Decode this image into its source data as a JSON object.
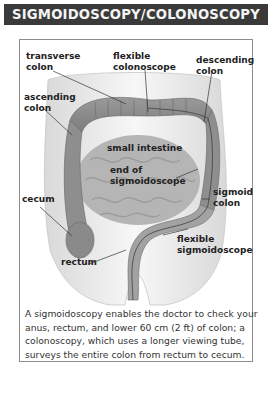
{
  "title": "SIGMOIDOSCOPY/COLONOSCOPY",
  "labels": {
    "transverse_colon": [
      "transverse",
      "colon"
    ],
    "flexible_colonoscope": [
      "flexible",
      "colonoscope"
    ],
    "descending_colon": [
      "descending",
      "colon"
    ],
    "ascending_colon": [
      "ascending",
      "colon"
    ],
    "small_intestine": [
      "small intestine"
    ],
    "end_of_sigmoidoscope": [
      "end of",
      "sigmoidoscope"
    ],
    "cecum": [
      "cecum"
    ],
    "sigmoid_colon": [
      "sigmoid",
      "colon"
    ],
    "flexible_sigmoidoscope": [
      "flexible",
      "sigmoidoscope"
    ],
    "rectum": [
      "rectum"
    ]
  },
  "caption": {
    "lines": [
      "A sigmoidoscopy enables the doctor to check your",
      "anus, rectum, and lower 60 cm (2 ft) of colon; a",
      "colonoscopy, which uses a longer viewing tube,",
      "surveys the entire colon from rectum to cecum."
    ]
  },
  "colors": {
    "banner_bg": "#3a3a3a",
    "banner_text": "#f4f4f4",
    "frame_border": "#8c8c8c",
    "label_text": "#222222",
    "caption_text": "#333333"
  }
}
